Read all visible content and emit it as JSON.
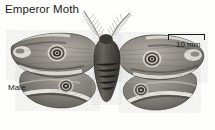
{
  "figure": {
    "title": "Emperor Moth",
    "sex_label": "Male",
    "image_type": "grayscale-photograph",
    "background_color": "#fdfdfc",
    "text_color": "#1a1a1a"
  },
  "scale_bar": {
    "caption": "10 mm",
    "value": 10,
    "unit": "mm",
    "style": "bracket",
    "bar_color": "#1a1a1a"
  },
  "specimen": {
    "common_name": "Emperor Moth",
    "pose": "wings-spread-dorsal",
    "antennae": "bipectinate-feathery",
    "eyespot_count": 4,
    "eyespots": [
      {
        "name": "forewing-left-eyespot",
        "cx": 57,
        "cy": 53,
        "r": 9
      },
      {
        "name": "forewing-right-eyespot",
        "cx": 152,
        "cy": 59,
        "r": 9
      },
      {
        "name": "hindwing-left-eyespot",
        "cx": 66,
        "cy": 86,
        "r": 7
      },
      {
        "name": "hindwing-right-eyespot",
        "cx": 141,
        "cy": 90,
        "r": 7
      }
    ],
    "tones": {
      "wing_dark": "#5d5a55",
      "wing_mid": "#8e8a84",
      "wing_light": "#d6d2cb",
      "wing_pale": "#efece6",
      "body_dark": "#3a3733",
      "outline": "#2b2926"
    }
  }
}
